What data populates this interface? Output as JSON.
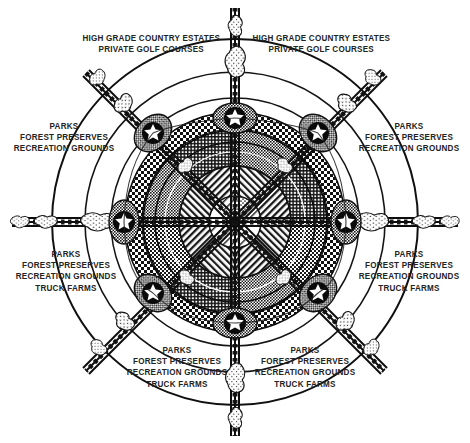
{
  "diagram": {
    "kind": "radial-satellite-city-plan",
    "title_visible": false,
    "center": {
      "x": 235,
      "y": 222
    },
    "colors": {
      "ink": "#1a1a1a",
      "paper": "#ffffff",
      "label_text": "#232323",
      "core_fill": "#2b2b2b",
      "belt_fill": "#3a3a3a"
    },
    "labels": [
      {
        "id": "top-left",
        "name": "label-high-grade-country-estates-nw",
        "lines": [
          "HIGH GRADE COUNTRY ESTATES",
          "PRIVATE GOLF COURSES"
        ]
      },
      {
        "id": "top-right",
        "name": "label-high-grade-country-estates-ne",
        "lines": [
          "HIGH GRADE COUNTRY ESTATES",
          "PRIVATE GOLF COURSES"
        ]
      },
      {
        "id": "mid-left",
        "name": "label-parks-west-upper",
        "lines": [
          "PARKS",
          "FOREST PRESERVES",
          "RECREATION GROUNDS"
        ]
      },
      {
        "id": "mid-right",
        "name": "label-parks-east-upper",
        "lines": [
          "PARKS",
          "FOREST PRESERVES",
          "RECREATION GROUNDS"
        ]
      },
      {
        "id": "low-left",
        "name": "label-parks-west-lower",
        "lines": [
          "PARKS",
          "FOREST PRESERVES",
          "RECREATION GROUNDS",
          "TRUCK FARMS"
        ]
      },
      {
        "id": "low-right",
        "name": "label-parks-east-lower",
        "lines": [
          "PARKS",
          "FOREST PRESERVES",
          "RECREATION GROUNDS",
          "TRUCK FARMS"
        ]
      },
      {
        "id": "bot-left",
        "name": "label-parks-south-west",
        "lines": [
          "PARKS",
          "FOREST PRESERVES",
          "RECREATION GROUNDS",
          "TRUCK FARMS"
        ]
      },
      {
        "id": "bot-right",
        "name": "label-parks-south-east",
        "lines": [
          "PARKS",
          "FOREST PRESERVES",
          "RECREATION GROUNDS",
          "TRUCK FARMS"
        ]
      }
    ],
    "rings": [
      {
        "name": "outer-ring-road",
        "radius": 183,
        "style": "thin-line"
      },
      {
        "name": "mid-ring-road",
        "radius": 150,
        "style": "thin-line"
      },
      {
        "name": "inner-ring-road",
        "radius": 124,
        "style": "thin-line"
      },
      {
        "name": "suburban-belt",
        "radius": 108,
        "style": "checker-band"
      },
      {
        "name": "dense-city-core",
        "radius": 92,
        "style": "dense-stipple"
      },
      {
        "name": "inner-core-band",
        "radius": 56,
        "style": "diagonal-hatch"
      },
      {
        "name": "civic-center",
        "radius": 26,
        "style": "light-hatch"
      }
    ],
    "spokes": [
      {
        "name": "spoke-north",
        "angle_deg": 270,
        "satellite": {
          "x": 235,
          "y": 118
        }
      },
      {
        "name": "spoke-south",
        "angle_deg": 90,
        "satellite": {
          "x": 235,
          "y": 323
        }
      },
      {
        "name": "spoke-west",
        "angle_deg": 180,
        "satellite": {
          "x": 124,
          "y": 222
        }
      },
      {
        "name": "spoke-east",
        "angle_deg": 0,
        "satellite": {
          "x": 346,
          "y": 222
        }
      },
      {
        "name": "spoke-northwest",
        "angle_deg": 225,
        "satellite": {
          "x": 153,
          "y": 133
        }
      },
      {
        "name": "spoke-northeast",
        "angle_deg": 315,
        "satellite": {
          "x": 318,
          "y": 133
        }
      },
      {
        "name": "spoke-southwest",
        "angle_deg": 135,
        "satellite": {
          "x": 153,
          "y": 293
        }
      },
      {
        "name": "spoke-southeast",
        "angle_deg": 45,
        "satellite": {
          "x": 318,
          "y": 293
        }
      }
    ],
    "satellite_marker": "six-point-star"
  }
}
